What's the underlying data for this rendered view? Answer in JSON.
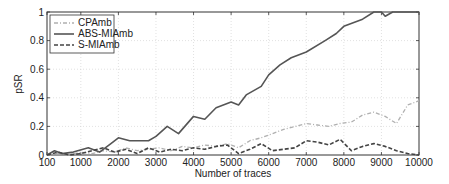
{
  "chart_data": {
    "type": "line",
    "title": "",
    "xlabel": "Number of traces",
    "ylabel": "pSR",
    "xlim": [
      100,
      10000
    ],
    "ylim": [
      0,
      1
    ],
    "grid": true,
    "legend_position": "upper left",
    "x_ticks": [
      "100",
      "1000",
      "2000",
      "3000",
      "4000",
      "5000",
      "6000",
      "7000",
      "8000",
      "9000",
      "10000"
    ],
    "y_ticks": [
      "0",
      "0.2",
      "0.4",
      "0.6",
      "0.8",
      "1"
    ],
    "series": [
      {
        "name": "CPAmb",
        "style": "dash-dot light gray",
        "color": "#b0b0b0",
        "x": [
          100,
          400,
          700,
          1000,
          1300,
          1600,
          1900,
          2200,
          2500,
          2800,
          3100,
          3400,
          3700,
          4000,
          4300,
          4600,
          4900,
          5200,
          5500,
          5800,
          6100,
          6400,
          6700,
          7000,
          7300,
          7600,
          7900,
          8200,
          8500,
          8800,
          9100,
          9400,
          9700,
          10000
        ],
        "values": [
          0,
          0.01,
          0.0,
          0.02,
          0.01,
          0.03,
          0.02,
          0.05,
          0.03,
          0.04,
          0.05,
          0.03,
          0.06,
          0.05,
          0.07,
          0.06,
          0.08,
          0.05,
          0.1,
          0.12,
          0.15,
          0.18,
          0.2,
          0.22,
          0.21,
          0.2,
          0.22,
          0.23,
          0.28,
          0.3,
          0.27,
          0.22,
          0.35,
          0.38
        ]
      },
      {
        "name": "ABS-MIAmb",
        "style": "solid dark gray",
        "color": "#555555",
        "x": [
          100,
          300,
          500,
          800,
          1200,
          1500,
          1800,
          2000,
          2300,
          2800,
          3000,
          3300,
          3600,
          4000,
          4300,
          4600,
          5000,
          5200,
          5400,
          5800,
          6000,
          6300,
          6600,
          7000,
          7500,
          7800,
          8000,
          8500,
          8800,
          9000,
          9100,
          9300,
          10000
        ],
        "values": [
          0,
          0.03,
          0.01,
          0.02,
          0.05,
          0.02,
          0.08,
          0.12,
          0.1,
          0.1,
          0.13,
          0.2,
          0.15,
          0.27,
          0.25,
          0.33,
          0.37,
          0.35,
          0.42,
          0.48,
          0.56,
          0.63,
          0.68,
          0.72,
          0.8,
          0.85,
          0.9,
          0.95,
          1.0,
          1.0,
          0.97,
          1.0,
          1.0
        ]
      },
      {
        "name": "S-MIAmb",
        "style": "dashed dark",
        "color": "#444444",
        "x": [
          100,
          400,
          700,
          1000,
          1300,
          1600,
          1900,
          2200,
          2500,
          2800,
          3100,
          3400,
          3700,
          4000,
          4300,
          4600,
          4900,
          5200,
          5500,
          5800,
          6100,
          6400,
          6700,
          7000,
          7300,
          7600,
          7900,
          8200,
          8500,
          8800,
          9100,
          9400,
          9700,
          10000
        ],
        "values": [
          0,
          0.02,
          0.0,
          0.01,
          0.03,
          0.05,
          0.02,
          0.04,
          0.01,
          0.05,
          0.02,
          0.04,
          0.03,
          0.05,
          0.04,
          0.06,
          0.07,
          0.01,
          0.04,
          0.08,
          0.03,
          0.04,
          0.05,
          0.1,
          0.09,
          0.07,
          0.11,
          0.03,
          0.06,
          0.08,
          0.06,
          0.03,
          0.01,
          0.0
        ]
      }
    ]
  }
}
